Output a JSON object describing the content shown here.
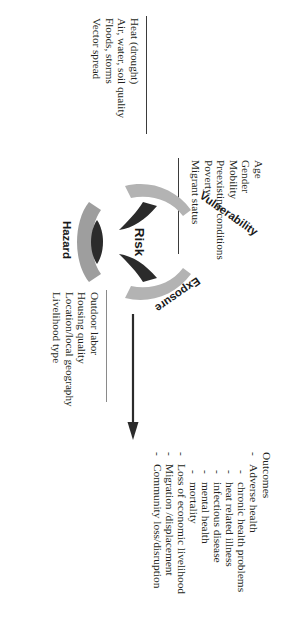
{
  "diagram": {
    "orientation_note": "figure rotated 90 degrees",
    "hub": {
      "label": "Risk"
    },
    "nodes": [
      {
        "id": "hazard",
        "label": "Hazard"
      },
      {
        "id": "exposure",
        "label": "Exposure"
      },
      {
        "id": "vulnerability",
        "label": "Vulnerability"
      }
    ],
    "hazard": {
      "label": "Hazard",
      "items": [
        "Heat (drought)",
        "Air, water, soil quality",
        "Floods, storms",
        "Vector spread"
      ]
    },
    "vulnerability": {
      "label": "Vulnerability",
      "items": [
        "Age",
        "Gender",
        "Mobility",
        "Preexisting conditions",
        "Poverty",
        "Migrant status"
      ]
    },
    "exposure": {
      "label": "Exposure",
      "items": [
        "Outdoor labor",
        "Housing quality",
        "Location/local geography",
        "Livelihood type"
      ]
    },
    "outcomes": {
      "title": "Outcomes",
      "dash": "-",
      "items": [
        {
          "label": "Adverse health",
          "sub": [
            "chronic health problems",
            "heat related illness",
            "infectious disease",
            "mental health",
            "mortality"
          ]
        },
        {
          "label": "Loss of economic livelihood",
          "sub": []
        },
        {
          "label": "Migration /displacement",
          "sub": []
        },
        {
          "label": "Community loss/disruption",
          "sub": []
        }
      ]
    },
    "colors": {
      "text": "#231f20",
      "arrow_dark": "#2b2b2b",
      "arrow_light": "#a8a8a8",
      "rule": "#3b3b3b"
    }
  }
}
